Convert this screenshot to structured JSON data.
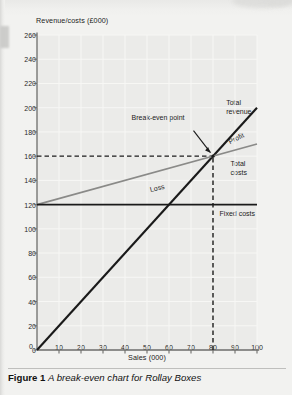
{
  "figure": {
    "label": "Figure 1",
    "caption": "A break-even chart for Rollay Boxes"
  },
  "chart_data": {
    "type": "line",
    "title": "",
    "xlabel": "Sales (000)",
    "ylabel": "Revenue/costs (£000)",
    "xlim": [
      0,
      100
    ],
    "ylim": [
      0,
      260
    ],
    "xticks": [
      0,
      10,
      20,
      30,
      40,
      50,
      60,
      70,
      80,
      90,
      100
    ],
    "yticks": [
      0,
      20,
      40,
      60,
      80,
      100,
      120,
      140,
      160,
      180,
      200,
      220,
      240,
      260
    ],
    "xtick_labels": [
      "0",
      "10",
      "20",
      "30",
      "40",
      "50",
      "60",
      "70",
      "80",
      "90",
      "100"
    ],
    "ytick_labels": [
      "0",
      "20",
      "40",
      "60",
      "80",
      "100",
      "120",
      "140",
      "160",
      "180",
      "200",
      "220",
      "240",
      "260"
    ],
    "grid": true,
    "legend": "none",
    "series": [
      {
        "name": "Total revenue",
        "color": "#1a1a1a",
        "style": "solid",
        "width": 2.1,
        "x": [
          0,
          100
        ],
        "values": [
          0,
          200
        ]
      },
      {
        "name": "Total costs",
        "color": "#8a8a88",
        "style": "solid",
        "width": 1.7,
        "x": [
          0,
          100
        ],
        "values": [
          120,
          170
        ]
      },
      {
        "name": "Fixed costs",
        "color": "#1a1a1a",
        "style": "solid",
        "width": 1.7,
        "x": [
          0,
          100
        ],
        "values": [
          120,
          120
        ]
      }
    ],
    "guides": [
      {
        "name": "break-even-horizontal",
        "orientation": "horizontal",
        "value": 160,
        "style": "dashed",
        "from": 0,
        "to": 80
      },
      {
        "name": "break-even-vertical",
        "orientation": "vertical",
        "value": 80,
        "style": "dashed",
        "from": 0,
        "to": 160
      }
    ],
    "points": [
      {
        "name": "break-even-point",
        "x": 80,
        "y": 160
      }
    ],
    "annotations": [
      {
        "name": "break-even-point-label",
        "text": "Break-even point",
        "x": 43,
        "y": 196,
        "rotation": 0
      },
      {
        "name": "total-revenue-label",
        "text": "Total\nrevenue",
        "x": 86,
        "y": 208,
        "rotation": 0
      },
      {
        "name": "profit-label",
        "text": "Profit",
        "x": 88,
        "y": 176,
        "rotation": -27
      },
      {
        "name": "total-costs-label",
        "text": "Total\ncosts",
        "x": 88,
        "y": 158,
        "rotation": 0
      },
      {
        "name": "loss-label",
        "text": "Loss",
        "x": 52,
        "y": 136,
        "rotation": -13
      },
      {
        "name": "fixed-costs-label",
        "text": "Fixed costs",
        "x": 83,
        "y": 116,
        "rotation": 0
      }
    ]
  }
}
